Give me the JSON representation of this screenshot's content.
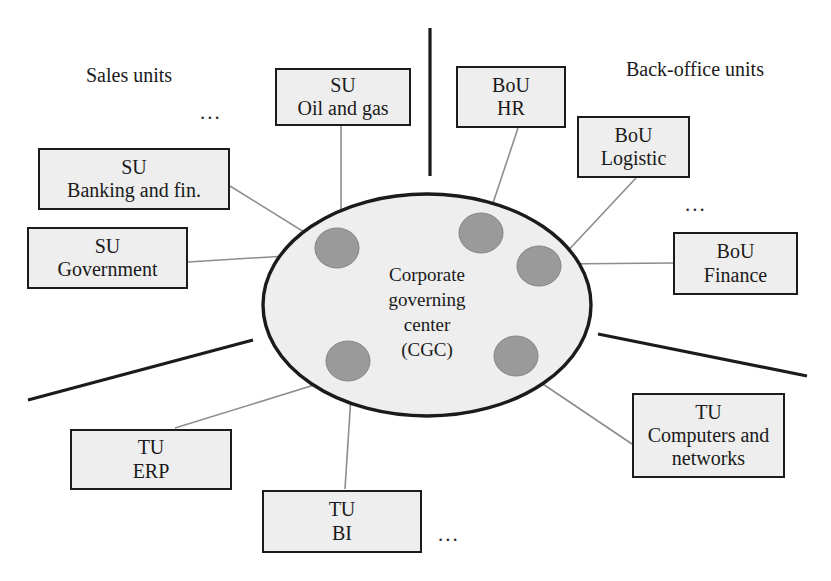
{
  "diagram": {
    "center": {
      "name": "corporate-governing-center",
      "lines": [
        "Corporate",
        "governing",
        "center",
        "(CGC)"
      ],
      "fill": "#eeeeee",
      "stroke": "#1b1b1b"
    },
    "group_labels": [
      {
        "id": "sales-units",
        "text": "Sales units"
      },
      {
        "id": "back-office-units",
        "text": "Back-office units"
      }
    ],
    "ellipsis_marks": [
      {
        "id": "sales-units-ellipsis",
        "text": "..."
      },
      {
        "id": "back-office-units-ellipsis",
        "text": "..."
      },
      {
        "id": "technology-units-ellipsis",
        "text": "..."
      }
    ],
    "units": [
      {
        "id": "su-oil-and-gas",
        "lines": [
          "SU",
          "Oil and gas"
        ]
      },
      {
        "id": "su-banking-and-fin",
        "lines": [
          "SU",
          "Banking and fin."
        ]
      },
      {
        "id": "su-government",
        "lines": [
          "SU",
          "Government"
        ]
      },
      {
        "id": "bou-hr",
        "lines": [
          "BoU",
          "HR"
        ]
      },
      {
        "id": "bou-logistic",
        "lines": [
          "BoU",
          "Logistic"
        ]
      },
      {
        "id": "bou-finance",
        "lines": [
          "BoU",
          "Finance"
        ]
      },
      {
        "id": "tu-erp",
        "lines": [
          "TU",
          "ERP"
        ]
      },
      {
        "id": "tu-bi",
        "lines": [
          "TU",
          "BI"
        ]
      },
      {
        "id": "tu-computers-and-networks",
        "lines": [
          "TU",
          "Computers and",
          "networks"
        ]
      }
    ],
    "colors": {
      "box_fill": "#eeeeee",
      "box_border": "#1b1b1b",
      "node_fill": "#9a9a9a",
      "node_stroke": "#7d7d7d",
      "connector": "#8d8d8d",
      "divider": "#1b1b1b"
    }
  }
}
